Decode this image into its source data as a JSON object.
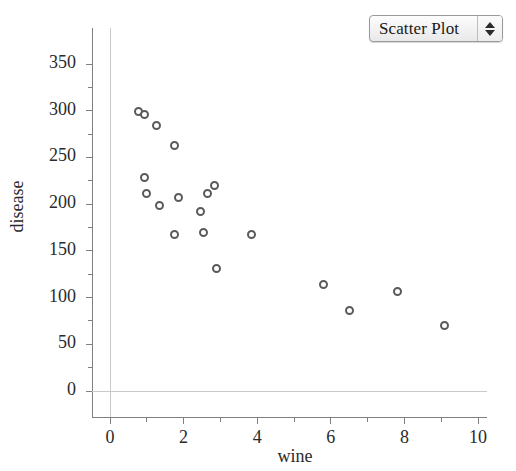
{
  "window": {
    "background": "#ffffff"
  },
  "control": {
    "type": "popup-button",
    "selected": "Scatter Plot",
    "stepper_up": "▲",
    "stepper_down": "▼"
  },
  "chart_data": {
    "type": "scatter",
    "title": "",
    "xlabel": "wine",
    "ylabel": "disease",
    "xlim": [
      -0.5,
      10.0
    ],
    "ylim": [
      -25,
      375
    ],
    "xticks": [
      0,
      2,
      4,
      6,
      8,
      10
    ],
    "xtick_labels": [
      "0",
      "2",
      "4",
      "6",
      "8",
      "10"
    ],
    "x_minor_ticks": [
      1,
      3,
      5,
      7,
      9
    ],
    "yticks": [
      0,
      50,
      100,
      150,
      200,
      250,
      300,
      350
    ],
    "ytick_labels": [
      "0",
      "50",
      "100",
      "150",
      "200",
      "250",
      "300",
      "350"
    ],
    "y_minor_ticks": [
      25,
      75,
      125,
      175,
      225,
      275,
      325
    ],
    "grid": false,
    "reference_lines": [
      {
        "axis": "y",
        "value": 0,
        "color": "#bdbdbd"
      },
      {
        "axis": "x",
        "value": 0,
        "color": "#bdbdbd"
      }
    ],
    "marker": {
      "shape": "circle-open",
      "edge_color": "#5a5a5a",
      "fill_color": "#ffffff",
      "size_px": 9
    },
    "legend": null,
    "n_points": 19,
    "points": [
      {
        "x": 0.78,
        "y": 299
      },
      {
        "x": 0.95,
        "y": 296
      },
      {
        "x": 1.25,
        "y": 284
      },
      {
        "x": 1.75,
        "y": 263
      },
      {
        "x": 0.95,
        "y": 228
      },
      {
        "x": 0.99,
        "y": 211
      },
      {
        "x": 1.35,
        "y": 199
      },
      {
        "x": 1.85,
        "y": 207
      },
      {
        "x": 2.45,
        "y": 192
      },
      {
        "x": 2.65,
        "y": 211
      },
      {
        "x": 2.85,
        "y": 220
      },
      {
        "x": 1.75,
        "y": 167
      },
      {
        "x": 2.55,
        "y": 170
      },
      {
        "x": 2.9,
        "y": 131
      },
      {
        "x": 3.85,
        "y": 167
      },
      {
        "x": 5.8,
        "y": 114
      },
      {
        "x": 6.5,
        "y": 86
      },
      {
        "x": 7.8,
        "y": 106
      },
      {
        "x": 9.1,
        "y": 70
      }
    ]
  },
  "axes_geometry": {
    "left_px": 110,
    "right_px": 478,
    "bottom_px": 391,
    "top_px": 64
  }
}
